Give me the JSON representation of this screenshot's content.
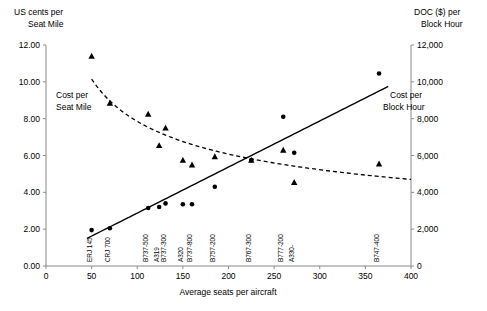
{
  "chart_data": {
    "type": "scatter",
    "title": "",
    "xlabel": "Average seats per aircraft",
    "ylabel_left_line1": "US cents per",
    "ylabel_left_line2": "Seat Mile",
    "ylabel_right_line1": "DOC ($) per",
    "ylabel_right_line2": "Block Hour",
    "xlim": [
      0,
      400
    ],
    "xticks": [
      0,
      50,
      100,
      150,
      200,
      250,
      300,
      350,
      400
    ],
    "xticklabels": [
      "0",
      "50",
      "100",
      "150",
      "200",
      "250",
      "300",
      "350",
      "400"
    ],
    "ylim_left": [
      0.0,
      12.0
    ],
    "yticks_left": [
      0.0,
      2.0,
      4.0,
      6.0,
      8.0,
      10.0,
      12.0
    ],
    "yticklabels_left": [
      "0.00",
      "2.00",
      "4.00",
      "6.00",
      "8.00",
      "10.00",
      "12.00"
    ],
    "ylim_right": [
      0,
      12000
    ],
    "yticks_right": [
      0,
      2000,
      4000,
      6000,
      8000,
      10000,
      12000
    ],
    "yticklabels_right": [
      "0",
      "2,000",
      "4,000",
      "6,000",
      "8,000",
      "10,000",
      "12,000"
    ],
    "grid": false,
    "legend_position": "inline-annotations",
    "annotations": [
      {
        "name": "cost-per-seat-mile",
        "line1": "Cost per",
        "line2": "Seat Mile",
        "x": 55,
        "y": 9.1
      },
      {
        "name": "cost-per-block-hour",
        "line1": "Cost per",
        "line2": "Block Hour",
        "x": 330,
        "y": 8.3
      }
    ],
    "category_labels": [
      {
        "label": "ERJ 145",
        "x": 50
      },
      {
        "label": "CRJ 700",
        "x": 70
      },
      {
        "label": "B737-500",
        "x": 112
      },
      {
        "label": "A319",
        "x": 124
      },
      {
        "label": "B737-300",
        "x": 131
      },
      {
        "label": "A320",
        "x": 150
      },
      {
        "label": "B737-800",
        "x": 160
      },
      {
        "label": "B757-200",
        "x": 185
      },
      {
        "label": "B767-300",
        "x": 225
      },
      {
        "label": "B777-200",
        "x": 260
      },
      {
        "label": "A330-",
        "x": 272
      },
      {
        "label": "B747-400",
        "x": 365
      }
    ],
    "series": [
      {
        "name": "Cost per Seat Mile",
        "marker": "triangle",
        "axis": "left",
        "unit": "US cents per seat mile",
        "points": [
          {
            "aircraft": "ERJ 145",
            "x": 50,
            "y": 11.4
          },
          {
            "aircraft": "CRJ 700",
            "x": 70,
            "y": 8.85
          },
          {
            "aircraft": "B737-500",
            "x": 112,
            "y": 8.25
          },
          {
            "aircraft": "B737-300",
            "x": 131,
            "y": 7.5
          },
          {
            "aircraft": "A319",
            "x": 124,
            "y": 6.55
          },
          {
            "aircraft": "A320",
            "x": 150,
            "y": 5.75
          },
          {
            "aircraft": "B737-800",
            "x": 160,
            "y": 5.5
          },
          {
            "aircraft": "B757-200",
            "x": 185,
            "y": 5.95
          },
          {
            "aircraft": "B767-300",
            "x": 225,
            "y": 5.75
          },
          {
            "aircraft": "B777-200",
            "x": 260,
            "y": 6.3
          },
          {
            "aircraft": "A330-",
            "x": 272,
            "y": 4.55
          },
          {
            "aircraft": "B747-400",
            "x": 365,
            "y": 5.55
          }
        ]
      },
      {
        "name": "Cost per Block Hour",
        "marker": "circle",
        "axis": "right",
        "unit": "DOC ($) per block hour",
        "points": [
          {
            "aircraft": "ERJ 145",
            "x": 50,
            "y": 1950
          },
          {
            "aircraft": "CRJ 700",
            "x": 70,
            "y": 2050
          },
          {
            "aircraft": "B737-500",
            "x": 112,
            "y": 3150
          },
          {
            "aircraft": "A319",
            "x": 124,
            "y": 3200
          },
          {
            "aircraft": "B737-300",
            "x": 131,
            "y": 3400
          },
          {
            "aircraft": "A320",
            "x": 150,
            "y": 3350
          },
          {
            "aircraft": "B737-800",
            "x": 160,
            "y": 3350
          },
          {
            "aircraft": "B757-200",
            "x": 185,
            "y": 4300
          },
          {
            "aircraft": "B767-300",
            "x": 225,
            "y": 5750
          },
          {
            "aircraft": "B777-200",
            "x": 260,
            "y": 8100
          },
          {
            "aircraft": "A330-",
            "x": 272,
            "y": 6150
          },
          {
            "aircraft": "B747-400",
            "x": 365,
            "y": 10450
          }
        ]
      }
    ],
    "trendlines": [
      {
        "name": "seat-mile-trend",
        "style": "dashed",
        "axis": "left",
        "kind": "power",
        "x_start": 50,
        "x_end": 400,
        "y_start": 10.15,
        "y_end": 4.7
      },
      {
        "name": "block-hour-trend",
        "style": "solid",
        "axis": "right",
        "kind": "linear",
        "x_start": 45,
        "x_end": 375,
        "y_start": 1500,
        "y_end": 9750
      }
    ]
  }
}
